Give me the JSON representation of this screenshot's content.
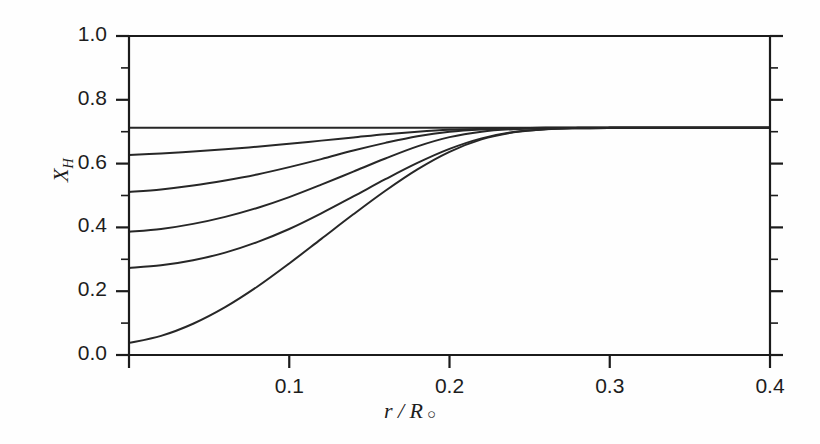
{
  "chart_data": {
    "type": "line",
    "title": "",
    "xlabel": "r / R",
    "xlabel_symbol": "○",
    "ylabel": "X",
    "ylabel_sub": "H",
    "xlim": [
      0.0,
      0.4
    ],
    "ylim": [
      0.0,
      1.0
    ],
    "xticks": [
      0.0,
      0.1,
      0.2,
      0.3,
      0.4
    ],
    "xtick_labels": [
      "",
      "0.1",
      "0.2",
      "0.3",
      "0.4"
    ],
    "yticks": [
      0.0,
      0.2,
      0.4,
      0.6,
      0.8,
      1.0
    ],
    "ytick_labels": [
      "0.0",
      "0.2",
      "0.4",
      "0.6",
      "0.8",
      "1.0"
    ],
    "grid": false,
    "legend": "none",
    "surface_abundance": 0.712,
    "series": [
      {
        "name": "initial-zero-age",
        "center_value": 0.712,
        "x": [
          0.0,
          0.02,
          0.04,
          0.06,
          0.08,
          0.1,
          0.12,
          0.14,
          0.16,
          0.18,
          0.2,
          0.22,
          0.24,
          0.26,
          0.28,
          0.3,
          0.32,
          0.34,
          0.36,
          0.38,
          0.4
        ],
        "values": [
          0.712,
          0.712,
          0.712,
          0.712,
          0.712,
          0.712,
          0.712,
          0.712,
          0.712,
          0.712,
          0.712,
          0.712,
          0.712,
          0.712,
          0.712,
          0.712,
          0.712,
          0.712,
          0.712,
          0.712,
          0.712
        ]
      },
      {
        "name": "stage-2",
        "center_value": 0.627,
        "x": [
          0.0,
          0.02,
          0.04,
          0.06,
          0.08,
          0.1,
          0.12,
          0.14,
          0.16,
          0.18,
          0.2,
          0.22,
          0.24,
          0.26,
          0.28,
          0.3,
          0.32,
          0.34,
          0.36,
          0.38,
          0.4
        ],
        "values": [
          0.627,
          0.632,
          0.638,
          0.645,
          0.653,
          0.662,
          0.672,
          0.682,
          0.692,
          0.7,
          0.706,
          0.709,
          0.711,
          0.712,
          0.712,
          0.712,
          0.712,
          0.712,
          0.712,
          0.712,
          0.712
        ]
      },
      {
        "name": "stage-3",
        "center_value": 0.511,
        "x": [
          0.0,
          0.02,
          0.04,
          0.06,
          0.08,
          0.1,
          0.12,
          0.14,
          0.16,
          0.18,
          0.2,
          0.22,
          0.24,
          0.26,
          0.28,
          0.3,
          0.32,
          0.34,
          0.36,
          0.38,
          0.4
        ],
        "values": [
          0.511,
          0.519,
          0.531,
          0.547,
          0.566,
          0.589,
          0.614,
          0.641,
          0.665,
          0.686,
          0.7,
          0.707,
          0.71,
          0.712,
          0.712,
          0.712,
          0.712,
          0.712,
          0.712,
          0.712,
          0.712
        ]
      },
      {
        "name": "stage-4",
        "center_value": 0.386,
        "x": [
          0.0,
          0.02,
          0.04,
          0.06,
          0.08,
          0.1,
          0.12,
          0.14,
          0.16,
          0.18,
          0.2,
          0.22,
          0.24,
          0.26,
          0.28,
          0.3,
          0.32,
          0.34,
          0.36,
          0.38,
          0.4
        ],
        "values": [
          0.386,
          0.395,
          0.411,
          0.433,
          0.461,
          0.495,
          0.534,
          0.575,
          0.616,
          0.654,
          0.683,
          0.7,
          0.708,
          0.711,
          0.712,
          0.712,
          0.712,
          0.712,
          0.712,
          0.712,
          0.712
        ]
      },
      {
        "name": "stage-5",
        "center_value": 0.273,
        "x": [
          0.0,
          0.02,
          0.04,
          0.06,
          0.08,
          0.1,
          0.12,
          0.14,
          0.16,
          0.18,
          0.2,
          0.22,
          0.24,
          0.26,
          0.28,
          0.3,
          0.32,
          0.34,
          0.36,
          0.38,
          0.4
        ],
        "values": [
          0.273,
          0.281,
          0.297,
          0.321,
          0.354,
          0.395,
          0.444,
          0.497,
          0.551,
          0.602,
          0.646,
          0.679,
          0.699,
          0.708,
          0.711,
          0.712,
          0.712,
          0.712,
          0.712,
          0.712,
          0.712
        ]
      },
      {
        "name": "stage-6-most-evolved",
        "center_value": 0.038,
        "x": [
          0.0,
          0.02,
          0.04,
          0.06,
          0.08,
          0.1,
          0.12,
          0.14,
          0.16,
          0.18,
          0.2,
          0.22,
          0.24,
          0.26,
          0.28,
          0.3,
          0.32,
          0.34,
          0.36,
          0.38,
          0.4
        ],
        "values": [
          0.038,
          0.06,
          0.098,
          0.15,
          0.214,
          0.287,
          0.364,
          0.441,
          0.515,
          0.582,
          0.637,
          0.676,
          0.698,
          0.708,
          0.711,
          0.712,
          0.712,
          0.712,
          0.712,
          0.712,
          0.712
        ]
      }
    ]
  },
  "axes": {
    "color": "#1b1b1b",
    "curve_color": "#272727",
    "background": "#ffffff"
  }
}
